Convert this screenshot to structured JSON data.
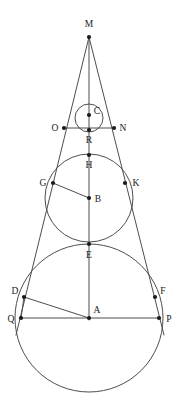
{
  "figure": {
    "background_color": "#ffffff",
    "line_color": "#4d4d4d",
    "point_color": "#1a1a1a",
    "label_color": "#1a1a1a",
    "canvas": {
      "width": 179,
      "height": 403
    },
    "points": [
      {
        "id": "M",
        "label": "M",
        "x": 89,
        "y": 37,
        "lx": 89,
        "ly": 27,
        "anchor": "middle"
      },
      {
        "id": "C",
        "label": "C",
        "x": 89,
        "y": 115,
        "lx": 97,
        "ly": 114,
        "anchor": "middle"
      },
      {
        "id": "O",
        "label": "O",
        "x": 64,
        "y": 128,
        "lx": 55,
        "ly": 131,
        "anchor": "middle"
      },
      {
        "id": "N",
        "label": "N",
        "x": 114,
        "y": 128,
        "lx": 123,
        "ly": 131,
        "anchor": "middle"
      },
      {
        "id": "R",
        "label": "R",
        "x": 89,
        "y": 130,
        "lx": 89,
        "ly": 143,
        "anchor": "middle"
      },
      {
        "id": "H",
        "label": "H",
        "x": 89,
        "y": 155,
        "lx": 89,
        "ly": 168,
        "anchor": "middle"
      },
      {
        "id": "G",
        "label": "G",
        "x": 53,
        "y": 183,
        "lx": 43,
        "ly": 186,
        "anchor": "middle"
      },
      {
        "id": "K",
        "label": "K",
        "x": 125,
        "y": 183,
        "lx": 136,
        "ly": 186,
        "anchor": "middle"
      },
      {
        "id": "B",
        "label": "B",
        "x": 89,
        "y": 198,
        "lx": 98,
        "ly": 202,
        "anchor": "middle"
      },
      {
        "id": "E",
        "label": "E",
        "x": 89,
        "y": 244,
        "lx": 89,
        "ly": 258,
        "anchor": "middle"
      },
      {
        "id": "D",
        "label": "D",
        "x": 24,
        "y": 297,
        "lx": 15,
        "ly": 294,
        "anchor": "middle"
      },
      {
        "id": "F",
        "label": "F",
        "x": 155,
        "y": 297,
        "lx": 163,
        "ly": 294,
        "anchor": "middle"
      },
      {
        "id": "Q",
        "label": "Q",
        "x": 21,
        "y": 318,
        "lx": 11,
        "ly": 322,
        "anchor": "middle"
      },
      {
        "id": "A",
        "label": "A",
        "x": 89,
        "y": 318,
        "lx": 97,
        "ly": 313,
        "anchor": "middle"
      },
      {
        "id": "P",
        "label": "P",
        "x": 159,
        "y": 318,
        "lx": 169,
        "ly": 322,
        "anchor": "middle"
      }
    ],
    "circles": [
      {
        "id": "circle-small-C",
        "cx": 89,
        "cy": 118,
        "r": 14,
        "name": "small-circle-center-C"
      },
      {
        "id": "circle-middle-B",
        "cx": 89,
        "cy": 198,
        "r": 44,
        "name": "middle-circle-center-B"
      },
      {
        "id": "circle-large-A",
        "cx": 89,
        "cy": 318,
        "r": 74,
        "name": "large-circle-center-A"
      }
    ],
    "segments": [
      {
        "id": "tangent-left",
        "x1": 89,
        "y1": 37,
        "x2": 16,
        "y2": 335,
        "name": "left-tangent-line-M-to-Q"
      },
      {
        "id": "tangent-right",
        "x1": 89,
        "y1": 37,
        "x2": 164,
        "y2": 335,
        "name": "right-tangent-line-M-to-P"
      },
      {
        "id": "axis-vertical",
        "x1": 89,
        "y1": 37,
        "x2": 89,
        "y2": 320,
        "name": "axis-of-symmetry-M-to-A"
      },
      {
        "id": "chord-ON",
        "x1": 64,
        "y1": 128,
        "x2": 114,
        "y2": 128,
        "name": "chord-O-N"
      },
      {
        "id": "radius-GB",
        "x1": 53,
        "y1": 183,
        "x2": 89,
        "y2": 198,
        "name": "radius-G-to-B"
      },
      {
        "id": "radius-DA",
        "x1": 24,
        "y1": 297,
        "x2": 89,
        "y2": 318,
        "name": "radius-D-to-A"
      },
      {
        "id": "chord-QP",
        "x1": 21,
        "y1": 318,
        "x2": 159,
        "y2": 318,
        "name": "chord-Q-P"
      },
      {
        "id": "seg-QD",
        "x1": 21,
        "y1": 318,
        "x2": 24,
        "y2": 297,
        "name": "segment-Q-to-D"
      }
    ]
  },
  "chart_data": {
    "type": "diagram",
    "labels": [
      "M",
      "C",
      "O",
      "N",
      "R",
      "H",
      "G",
      "K",
      "B",
      "E",
      "D",
      "F",
      "Q",
      "A",
      "P"
    ],
    "circle_centers": [
      "C",
      "B",
      "A"
    ],
    "circle_radii": [
      14,
      44,
      74
    ],
    "tangency_points": [
      "R",
      "H",
      "E"
    ],
    "tangent_contacts_left": [
      "O",
      "G",
      "D"
    ],
    "tangent_contacts_right": [
      "N",
      "K",
      "F"
    ],
    "baseline_endpoints": [
      "Q",
      "P"
    ]
  }
}
